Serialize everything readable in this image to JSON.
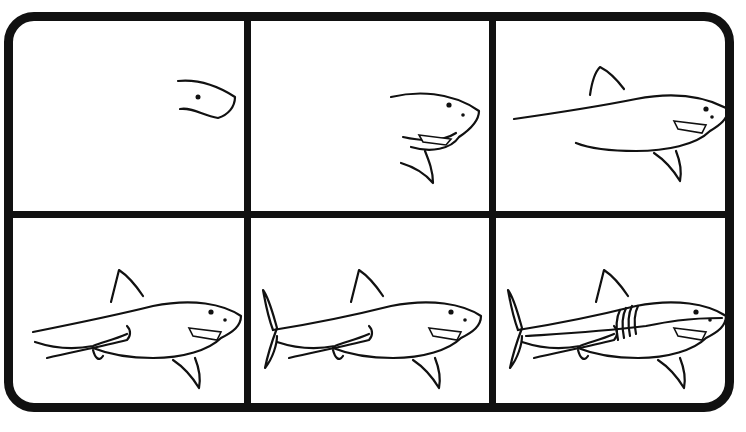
{
  "illustration": {
    "subject": "How to draw a shark",
    "layout": {
      "rows": 2,
      "columns": 3
    },
    "colors": {
      "line": "#111111",
      "background": "#ffffff"
    },
    "steps": [
      {
        "step": 1,
        "description": "Head outline with eye"
      },
      {
        "step": 2,
        "description": "Head with mouth, teeth, nostril and pectoral fin"
      },
      {
        "step": 3,
        "description": "Body outline and dorsal fin"
      },
      {
        "step": 4,
        "description": "Pelvic fins and underside detail"
      },
      {
        "step": 5,
        "description": "Tail fin added"
      },
      {
        "step": 6,
        "description": "Gill slits and lateral line details"
      }
    ]
  }
}
